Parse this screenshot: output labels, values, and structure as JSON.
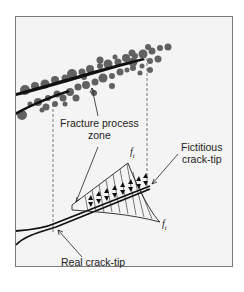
{
  "diagram": {
    "labels": {
      "fracture_process_zone_line1": "Fracture process",
      "fracture_process_zone_line2": "zone",
      "fictitious_tip_line1": "Fictitious",
      "fictitious_tip_line2": "crack-tip",
      "real_tip": "Real crack-tip",
      "ft_top": "f",
      "ft_top_sub": "t",
      "ft_bottom": "f",
      "ft_bottom_sub": "t"
    },
    "colors": {
      "frame_border": "#7a7a7a",
      "frame_fill": "#f4f4f4",
      "aggregate": "#555555",
      "crack_line": "#111111",
      "dashed": "#666666"
    }
  }
}
